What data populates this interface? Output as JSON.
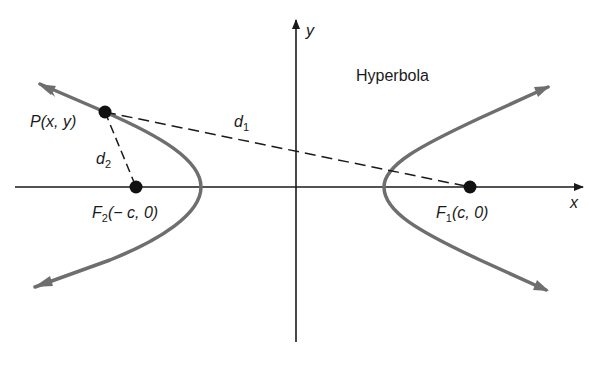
{
  "title": "Hyperbola",
  "axes": {
    "x_label": "x",
    "y_label": "y"
  },
  "points": {
    "P": {
      "name": "P",
      "coords": "(x, y)"
    },
    "F1": {
      "name": "F",
      "sub": "1",
      "coords": "(c, 0)"
    },
    "F2": {
      "name": "F",
      "sub": "2",
      "coords": "(− c, 0)"
    }
  },
  "distances": {
    "d1": {
      "name": "d",
      "sub": "1"
    },
    "d2": {
      "name": "d",
      "sub": "2"
    }
  },
  "colors": {
    "curve": "#6e6e6e",
    "axis": "#1a1a1a",
    "point": "#111111"
  }
}
